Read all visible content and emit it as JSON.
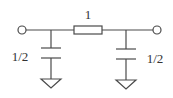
{
  "diagram": {
    "type": "circuit",
    "topology": "pi-network",
    "components": [
      {
        "id": "C1",
        "kind": "capacitor",
        "label": "1/2",
        "position": "left-shunt"
      },
      {
        "id": "R1",
        "kind": "series-element",
        "label": "1",
        "position": "series"
      },
      {
        "id": "C2",
        "kind": "capacitor",
        "label": "1/2",
        "position": "right-shunt"
      }
    ],
    "terminals": [
      {
        "id": "input",
        "position": "left"
      },
      {
        "id": "output",
        "position": "right"
      }
    ],
    "grounds": [
      {
        "id": "gnd-left"
      },
      {
        "id": "gnd-right"
      }
    ],
    "labels": {
      "series": "1",
      "left_cap": "1/2",
      "right_cap": "1/2"
    },
    "colors": {
      "line": "#4a4a4a",
      "text": "#333333",
      "background": "#ffffff"
    }
  }
}
